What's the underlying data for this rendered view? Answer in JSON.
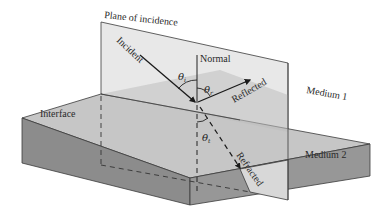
{
  "diagram": {
    "labels": {
      "plane": "Plane of incidence",
      "incident": "Incident",
      "normal": "Normal",
      "reflected": "Reflected",
      "refracted": "Refracted",
      "interface": "Interface",
      "medium1": "Medium 1",
      "medium2": "Medium 2"
    },
    "angles": {
      "incident": {
        "symbol": "θ",
        "sub": "i"
      },
      "reflected": {
        "symbol": "θ",
        "sub": "r"
      },
      "transmitted": {
        "symbol": "θ",
        "sub": "t"
      }
    },
    "colors": {
      "plane": "#e6e6e6",
      "plane_lower": "#d0d0d0",
      "slab_top": "#c4c4c4",
      "slab_top_in_plane": "#b8b8b8",
      "slab_front": "#8a8a8a",
      "slab_side": "#969696",
      "lines": "#2a2a2a"
    }
  }
}
